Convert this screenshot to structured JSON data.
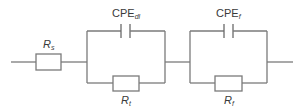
{
  "diagram": {
    "type": "equivalent-circuit",
    "colors": {
      "wire": "#7a7a7a",
      "text": "#3a3a3a",
      "background": "#ffffff"
    },
    "components": {
      "rs": {
        "main": "R",
        "sub": "s",
        "kind": "resistor"
      },
      "cpe_dl": {
        "main": "CPE",
        "sub": "dl",
        "kind": "constant-phase-element"
      },
      "rt": {
        "main": "R",
        "sub": "t",
        "kind": "resistor"
      },
      "cpe_f": {
        "main": "CPE",
        "sub": "f",
        "kind": "constant-phase-element"
      },
      "rf": {
        "main": "R",
        "sub": "f",
        "kind": "resistor"
      }
    },
    "topology": [
      {
        "element": "rs",
        "connection": "series"
      },
      {
        "block": 1,
        "connection": "parallel",
        "elements": [
          "cpe_dl",
          "rt"
        ]
      },
      {
        "block": 2,
        "connection": "parallel",
        "elements": [
          "cpe_f",
          "rf"
        ]
      }
    ]
  }
}
